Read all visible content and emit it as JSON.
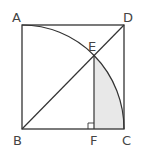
{
  "diagram": {
    "type": "geometry",
    "labels": {
      "A": "A",
      "B": "B",
      "C": "C",
      "D": "D",
      "E": "E",
      "F": "F"
    },
    "colors": {
      "stroke": "#333333",
      "shade": "#e6e6e6"
    }
  }
}
